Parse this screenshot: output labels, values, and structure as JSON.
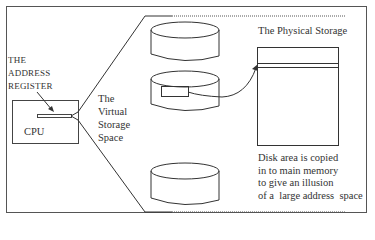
{
  "diagram": {
    "register_label": [
      "THE",
      "ADDRESS",
      "REGISTER"
    ],
    "cpu_label": "CPU",
    "virtual_storage_label": [
      "The",
      "Virtual",
      "Storage",
      "Space"
    ],
    "physical_storage_label": "The Physical Storage",
    "caption_lines": [
      "Disk area is copied",
      "in to main memory",
      "to give an illusion",
      "of a  large address  space"
    ],
    "disks": [
      {
        "name": "disk-1"
      },
      {
        "name": "disk-2",
        "has_highlighted_area": true
      },
      {
        "name": "disk-3"
      }
    ],
    "colors": {
      "line": "#333333",
      "background": "#ffffff",
      "frame": "#555555"
    }
  }
}
